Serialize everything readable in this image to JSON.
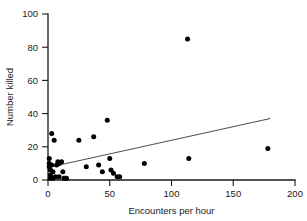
{
  "chart_data": {
    "type": "scatter",
    "title": "",
    "xlabel": "Encounters per hour",
    "ylabel": "Number killed",
    "xlim": [
      0,
      200
    ],
    "ylim": [
      0,
      100
    ],
    "xticks": [
      0,
      50,
      100,
      150,
      200
    ],
    "yticks": [
      0,
      20,
      40,
      60,
      80,
      100
    ],
    "xtick_labels": [
      "0",
      "50",
      "100",
      "150",
      "200"
    ],
    "ytick_labels": [
      "0",
      "20",
      "40",
      "60",
      "80",
      "100"
    ],
    "grid": false,
    "legend": "none",
    "marker_color": "#000000",
    "marker_shape": "circle",
    "trendline_color": "#555555",
    "points": [
      {
        "x": 1,
        "y": 13
      },
      {
        "x": 1,
        "y": 10
      },
      {
        "x": 1,
        "y": 8
      },
      {
        "x": 2,
        "y": 6
      },
      {
        "x": 2,
        "y": 3
      },
      {
        "x": 2,
        "y": 1
      },
      {
        "x": 3,
        "y": 9
      },
      {
        "x": 3,
        "y": 28
      },
      {
        "x": 4,
        "y": 5
      },
      {
        "x": 4,
        "y": 1
      },
      {
        "x": 5,
        "y": 24
      },
      {
        "x": 6,
        "y": 2
      },
      {
        "x": 7,
        "y": 9
      },
      {
        "x": 8,
        "y": 11
      },
      {
        "x": 9,
        "y": 10
      },
      {
        "x": 9,
        "y": 2
      },
      {
        "x": 11,
        "y": 11
      },
      {
        "x": 12,
        "y": 5
      },
      {
        "x": 13,
        "y": 1
      },
      {
        "x": 14,
        "y": 1
      },
      {
        "x": 15,
        "y": 1
      },
      {
        "x": 25,
        "y": 24
      },
      {
        "x": 31,
        "y": 8
      },
      {
        "x": 37,
        "y": 26
      },
      {
        "x": 41,
        "y": 9
      },
      {
        "x": 44,
        "y": 5
      },
      {
        "x": 48,
        "y": 36
      },
      {
        "x": 50,
        "y": 13
      },
      {
        "x": 51,
        "y": 6
      },
      {
        "x": 53,
        "y": 4
      },
      {
        "x": 56,
        "y": 2
      },
      {
        "x": 58,
        "y": 2
      },
      {
        "x": 78,
        "y": 10
      },
      {
        "x": 113,
        "y": 85
      },
      {
        "x": 114,
        "y": 13
      },
      {
        "x": 178,
        "y": 19
      }
    ],
    "trendline": {
      "x0": 0,
      "y0": 7.5,
      "x1": 180,
      "y1": 37
    }
  }
}
